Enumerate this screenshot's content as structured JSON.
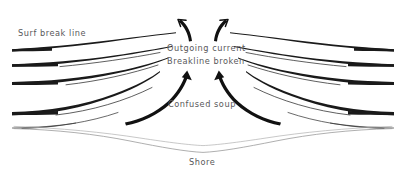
{
  "diagram": {
    "style": "hand-drawn pen sketch",
    "background_color": "#ffffff",
    "ink_color": "#1a1a1a",
    "label_color": "#58585a",
    "shore_line_color": "#9a9a9a",
    "labels": {
      "surf_break_line": "Surf break line",
      "outgoing_current": "Outgoing current",
      "breakline_broken": "Breakline broken",
      "confused_soup": "Confused soup",
      "shore": "Shore"
    },
    "elements": {
      "wave_lines_left_count": 5,
      "wave_lines_right_count": 5,
      "outgoing_arrows_count": 2,
      "inflow_arrows_count": 2,
      "shore_lines_count": 2
    }
  }
}
